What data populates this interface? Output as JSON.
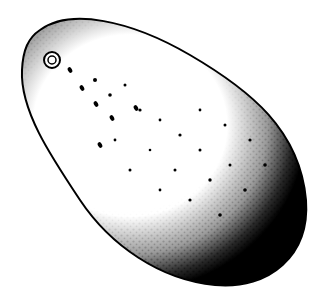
{
  "image": {
    "subject": "stippled avocado illustration",
    "background_color": "#ffffff",
    "ink_color": "#000000",
    "width": 331,
    "height": 297
  }
}
